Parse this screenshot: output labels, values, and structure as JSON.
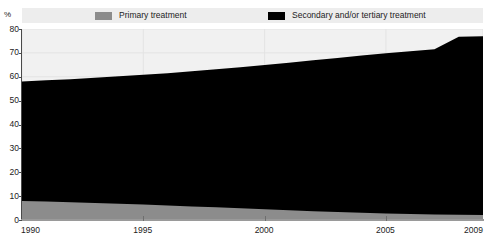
{
  "legend": {
    "entries": [
      {
        "label": "Primary treatment",
        "color": "#8c8c8c"
      },
      {
        "label": "Secondary and/or tertiary treatment",
        "color": "#000000"
      }
    ]
  },
  "axes": {
    "y_unit": "%",
    "y_ticks": [
      "80",
      "70",
      "60",
      "50",
      "40",
      "30",
      "20",
      "10",
      "0"
    ],
    "x_ticks": [
      "1990",
      "1995",
      "2000",
      "2005",
      "2009"
    ]
  },
  "chart_data": {
    "type": "area",
    "title": "",
    "subtitle": "",
    "xlabel": "",
    "ylabel": "%",
    "stacked": true,
    "grid": true,
    "legend_position": "top",
    "xlim": [
      1990,
      2009
    ],
    "ylim": [
      0,
      80
    ],
    "y_ticks": [
      0,
      10,
      20,
      30,
      40,
      50,
      60,
      70,
      80
    ],
    "x_tick_labels": [
      1990,
      1995,
      2000,
      2005,
      2009
    ],
    "x": [
      1990,
      1991,
      1992,
      1993,
      1994,
      1995,
      1996,
      1997,
      1998,
      1999,
      2000,
      2001,
      2002,
      2003,
      2004,
      2005,
      2006,
      2007,
      2008,
      2009
    ],
    "series": [
      {
        "name": "Primary treatment",
        "color": "#8c8c8c",
        "values": [
          8.0,
          7.7,
          7.4,
          7.1,
          6.8,
          6.5,
          6.1,
          5.7,
          5.3,
          4.9,
          4.5,
          4.1,
          3.7,
          3.3,
          3.0,
          2.7,
          2.5,
          2.3,
          2.2,
          2.1
        ]
      },
      {
        "name": "Secondary and/or tertiary treatment",
        "color": "#000000",
        "values": [
          50.0,
          50.8,
          51.6,
          52.5,
          53.4,
          54.3,
          55.4,
          56.6,
          57.8,
          59.1,
          60.4,
          61.8,
          63.2,
          64.6,
          65.9,
          67.1,
          68.2,
          69.2,
          74.6,
          74.9
        ]
      }
    ],
    "totals": [
      58.0,
      58.5,
      59.0,
      59.6,
      60.2,
      60.8,
      61.5,
      62.3,
      63.1,
      64.0,
      64.9,
      65.9,
      66.9,
      67.9,
      68.9,
      69.8,
      70.7,
      71.5,
      76.8,
      77.0
    ]
  }
}
